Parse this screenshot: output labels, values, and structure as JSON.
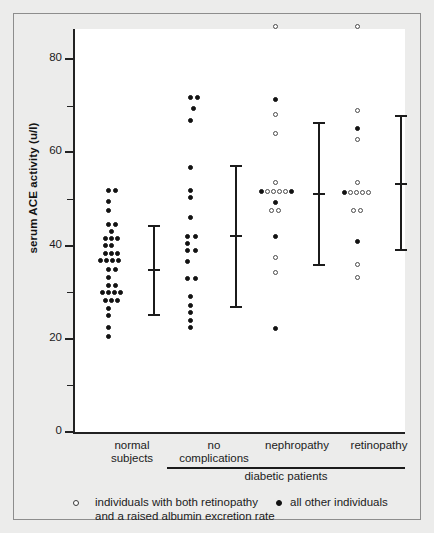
{
  "figure": {
    "background_color": "#ececeb",
    "plot_background_color": "#ffffff",
    "axis_color": "#222222"
  },
  "legend": {
    "open_marker_name": "open-circle-marker",
    "filled_marker_name": "filled-circle-marker",
    "open_label_line1": "individuals with both retinopathy",
    "open_label_line2": "and a raised albumin excretion rate",
    "filled_label": "all other individuals"
  },
  "group_bracket": {
    "label": "diabetic patients"
  },
  "chart_data": {
    "type": "scatter",
    "title": "",
    "xlabel": "",
    "ylabel": "serum ACE activity (u/l)",
    "ylim": [
      0,
      90
    ],
    "yticks": [
      0,
      20,
      40,
      60,
      80
    ],
    "ytick_labels": [
      "0",
      "20",
      "40",
      "60",
      "80"
    ],
    "yminorticks": [
      10,
      30,
      50,
      70
    ],
    "grid": false,
    "legend_position": "below-axes",
    "categories": [
      "normal subjects",
      "no complications",
      "nephropathy",
      "retinopathy"
    ],
    "category_labels": [
      {
        "line1": "normal",
        "line2": "subjects"
      },
      {
        "line1": "no",
        "line2": "complications"
      },
      {
        "line1": "nephropathy",
        "line2": ""
      },
      {
        "line1": "retinopathy",
        "line2": ""
      }
    ],
    "marker_legend": {
      "open": "individuals with both retinopathy and a raised albumin excretion rate",
      "filled": "all other individuals"
    },
    "groups": [
      {
        "name": "normal subjects",
        "x_center_px": 110,
        "errorbar": {
          "upper": 44.5,
          "mean": 35.0,
          "lower": 25.3
        },
        "points": [
          {
            "value": 51.8,
            "marker": "filled",
            "offset": -4
          },
          {
            "value": 51.8,
            "marker": "filled",
            "offset": 3
          },
          {
            "value": 49.4,
            "marker": "filled",
            "offset": -4
          },
          {
            "value": 47.6,
            "marker": "filled",
            "offset": -4
          },
          {
            "value": 44.6,
            "marker": "filled",
            "offset": -4
          },
          {
            "value": 44.6,
            "marker": "filled",
            "offset": 3
          },
          {
            "value": 43.0,
            "marker": "filled",
            "offset": -1
          },
          {
            "value": 41.4,
            "marker": "filled",
            "offset": -7
          },
          {
            "value": 41.4,
            "marker": "filled",
            "offset": -1
          },
          {
            "value": 41.4,
            "marker": "filled",
            "offset": 5
          },
          {
            "value": 39.9,
            "marker": "filled",
            "offset": -7
          },
          {
            "value": 39.9,
            "marker": "filled",
            "offset": -1
          },
          {
            "value": 38.3,
            "marker": "filled",
            "offset": -7
          },
          {
            "value": 38.3,
            "marker": "filled",
            "offset": -1
          },
          {
            "value": 38.3,
            "marker": "filled",
            "offset": 5
          },
          {
            "value": 36.7,
            "marker": "filled",
            "offset": -12
          },
          {
            "value": 36.7,
            "marker": "filled",
            "offset": -6
          },
          {
            "value": 36.7,
            "marker": "filled",
            "offset": 0
          },
          {
            "value": 36.7,
            "marker": "filled",
            "offset": 6
          },
          {
            "value": 34.9,
            "marker": "filled",
            "offset": -4
          },
          {
            "value": 34.9,
            "marker": "filled",
            "offset": 3
          },
          {
            "value": 33.1,
            "marker": "filled",
            "offset": -4
          },
          {
            "value": 31.5,
            "marker": "filled",
            "offset": -4
          },
          {
            "value": 31.5,
            "marker": "filled",
            "offset": 3
          },
          {
            "value": 29.9,
            "marker": "filled",
            "offset": -10
          },
          {
            "value": 29.9,
            "marker": "filled",
            "offset": -4
          },
          {
            "value": 29.9,
            "marker": "filled",
            "offset": 2
          },
          {
            "value": 29.9,
            "marker": "filled",
            "offset": 8
          },
          {
            "value": 28.3,
            "marker": "filled",
            "offset": -7
          },
          {
            "value": 28.3,
            "marker": "filled",
            "offset": -1
          },
          {
            "value": 28.3,
            "marker": "filled",
            "offset": 5
          },
          {
            "value": 26.5,
            "marker": "filled",
            "offset": -4
          },
          {
            "value": 24.9,
            "marker": "filled",
            "offset": -4
          },
          {
            "value": 22.4,
            "marker": "filled",
            "offset": -4
          },
          {
            "value": 20.5,
            "marker": "filled",
            "offset": -4
          }
        ]
      },
      {
        "name": "no complications",
        "x_center_px": 192,
        "errorbar": {
          "upper": 57.2,
          "mean": 42.2,
          "lower": 27.0
        },
        "points": [
          {
            "value": 71.8,
            "marker": "filled",
            "offset": -4
          },
          {
            "value": 71.8,
            "marker": "filled",
            "offset": 3
          },
          {
            "value": 69.4,
            "marker": "filled",
            "offset": -1
          },
          {
            "value": 66.9,
            "marker": "filled",
            "offset": -4
          },
          {
            "value": 56.8,
            "marker": "filled",
            "offset": -4
          },
          {
            "value": 51.8,
            "marker": "filled",
            "offset": -4
          },
          {
            "value": 50.3,
            "marker": "filled",
            "offset": -4
          },
          {
            "value": 46.1,
            "marker": "filled",
            "offset": -4
          },
          {
            "value": 42.0,
            "marker": "filled",
            "offset": -7
          },
          {
            "value": 42.0,
            "marker": "filled",
            "offset": 1
          },
          {
            "value": 40.5,
            "marker": "filled",
            "offset": -7
          },
          {
            "value": 39.0,
            "marker": "filled",
            "offset": -7
          },
          {
            "value": 39.0,
            "marker": "filled",
            "offset": 1
          },
          {
            "value": 36.5,
            "marker": "filled",
            "offset": -7
          },
          {
            "value": 33.0,
            "marker": "filled",
            "offset": -7
          },
          {
            "value": 33.0,
            "marker": "filled",
            "offset": 1
          },
          {
            "value": 29.0,
            "marker": "filled",
            "offset": -4
          },
          {
            "value": 27.2,
            "marker": "filled",
            "offset": -4
          },
          {
            "value": 25.6,
            "marker": "filled",
            "offset": -4
          },
          {
            "value": 24.0,
            "marker": "filled",
            "offset": -4
          },
          {
            "value": 22.4,
            "marker": "filled",
            "offset": -4
          }
        ]
      },
      {
        "name": "nephropathy",
        "x_center_px": 275,
        "errorbar": {
          "upper": 66.5,
          "mean": 51.3,
          "lower": 36.0
        },
        "points": [
          {
            "value": 87.0,
            "marker": "open",
            "offset": -2
          },
          {
            "value": 71.3,
            "marker": "filled",
            "offset": -2
          },
          {
            "value": 68.0,
            "marker": "open",
            "offset": -2
          },
          {
            "value": 64.0,
            "marker": "open",
            "offset": -2
          },
          {
            "value": 53.5,
            "marker": "open",
            "offset": -2
          },
          {
            "value": 51.5,
            "marker": "filled",
            "offset": -16
          },
          {
            "value": 51.5,
            "marker": "open",
            "offset": -10
          },
          {
            "value": 51.5,
            "marker": "open",
            "offset": -4
          },
          {
            "value": 51.5,
            "marker": "open",
            "offset": 2
          },
          {
            "value": 51.5,
            "marker": "open",
            "offset": 8
          },
          {
            "value": 51.5,
            "marker": "filled",
            "offset": 14
          },
          {
            "value": 49.2,
            "marker": "filled",
            "offset": -2
          },
          {
            "value": 47.6,
            "marker": "open",
            "offset": -6
          },
          {
            "value": 47.6,
            "marker": "open",
            "offset": 1
          },
          {
            "value": 42.0,
            "marker": "filled",
            "offset": -2
          },
          {
            "value": 37.5,
            "marker": "open",
            "offset": -2
          },
          {
            "value": 34.2,
            "marker": "open",
            "offset": -2
          },
          {
            "value": 22.3,
            "marker": "filled",
            "offset": -2
          }
        ]
      },
      {
        "name": "retinopathy",
        "x_center_px": 357,
        "errorbar": {
          "upper": 68.0,
          "mean": 53.5,
          "lower": 39.3
        },
        "points": [
          {
            "value": 87.0,
            "marker": "open",
            "offset": -2
          },
          {
            "value": 69.0,
            "marker": "open",
            "offset": -2
          },
          {
            "value": 65.0,
            "marker": "filled",
            "offset": -2
          },
          {
            "value": 62.8,
            "marker": "open",
            "offset": -2
          },
          {
            "value": 53.5,
            "marker": "open",
            "offset": -2
          },
          {
            "value": 51.4,
            "marker": "filled",
            "offset": -15
          },
          {
            "value": 51.4,
            "marker": "open",
            "offset": -9
          },
          {
            "value": 51.4,
            "marker": "open",
            "offset": -3
          },
          {
            "value": 51.4,
            "marker": "open",
            "offset": 3
          },
          {
            "value": 51.4,
            "marker": "open",
            "offset": 9
          },
          {
            "value": 47.6,
            "marker": "open",
            "offset": -6
          },
          {
            "value": 47.6,
            "marker": "open",
            "offset": 1
          },
          {
            "value": 40.8,
            "marker": "filled",
            "offset": -2
          },
          {
            "value": 36.0,
            "marker": "open",
            "offset": -2
          },
          {
            "value": 33.2,
            "marker": "open",
            "offset": -2
          }
        ]
      }
    ]
  }
}
